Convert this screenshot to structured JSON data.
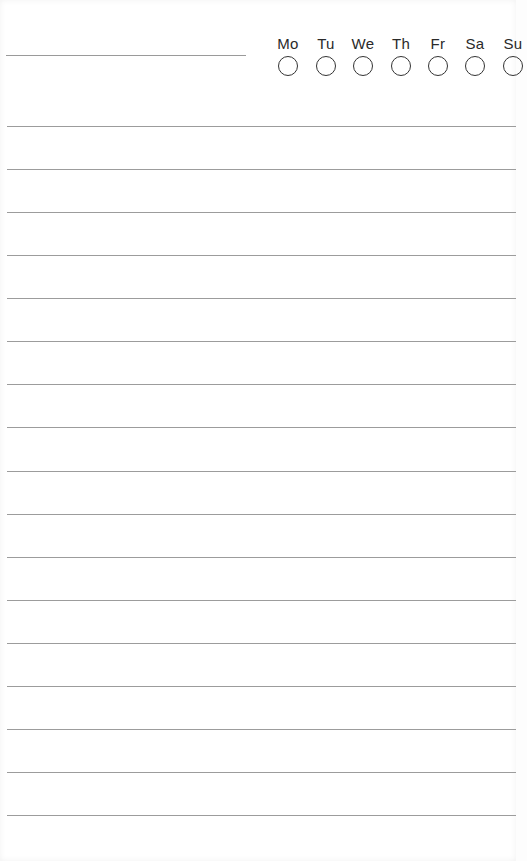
{
  "header": {
    "title_value": "",
    "days": [
      "Mo",
      "Tu",
      "We",
      "Th",
      "Fr",
      "Sa",
      "Su"
    ]
  },
  "tracker": {
    "checked": [
      false,
      false,
      false,
      false,
      false,
      false,
      false
    ]
  },
  "lines": {
    "count": 17,
    "entries": [
      "",
      "",
      "",
      "",
      "",
      "",
      "",
      "",
      "",
      "",
      "",
      "",
      "",
      "",
      "",
      "",
      ""
    ]
  },
  "colors": {
    "line": "#9c9c9c",
    "text": "#2a2a2a",
    "circle": "#333333",
    "background": "#ffffff"
  }
}
